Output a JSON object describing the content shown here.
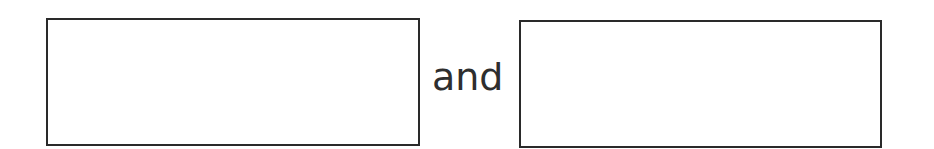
{
  "worksheet": {
    "left_box": {
      "value": ""
    },
    "connector_text": "and",
    "right_box": {
      "value": ""
    }
  },
  "colors": {
    "border": "#2a2a2a",
    "text": "#2e2e2e",
    "background": "#ffffff"
  }
}
